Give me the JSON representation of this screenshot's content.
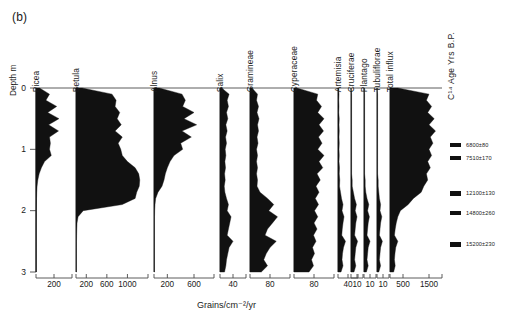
{
  "figure": {
    "panel_label": "(b)",
    "depth_axis_caption": "Depth m",
    "c14_caption": "C¹⁴ Age Yrs B.P.",
    "x_axis_caption": "Grains/cm⁻²/yr",
    "depth_ticks": [
      "0",
      "1",
      "2",
      "3"
    ],
    "fill_color": "#111111",
    "axis_color": "#4a4a4a"
  },
  "taxa": [
    {
      "name": "Picea",
      "ticks": [
        "200"
      ]
    },
    {
      "name": "Betula",
      "ticks": [
        "200",
        "600",
        "1000"
      ]
    },
    {
      "name": "Alnus",
      "ticks": [
        "200",
        "600"
      ]
    },
    {
      "name": "Salix",
      "ticks": [
        "40"
      ]
    },
    {
      "name": "Gramineae",
      "ticks": [
        "80"
      ]
    },
    {
      "name": "Cyperaceae",
      "ticks": [
        "80"
      ]
    },
    {
      "name": "Artemisia",
      "ticks": [
        "40"
      ]
    },
    {
      "name": "Cruciferae",
      "ticks": [
        "10"
      ]
    },
    {
      "name": "Plantago",
      "ticks": [
        "10"
      ]
    },
    {
      "name": "Tubuliflorae",
      "ticks": [
        "10"
      ]
    },
    {
      "name": "Total influx",
      "ticks": [
        "500",
        "1500"
      ]
    }
  ],
  "radiocarbon_dates": [
    {
      "label": "6800±80",
      "depth_m": 0.93
    },
    {
      "label": "7510±170",
      "depth_m": 1.14
    },
    {
      "label": "12100±130",
      "depth_m": 1.72
    },
    {
      "label": "14800±260",
      "depth_m": 2.04
    },
    {
      "label": "15200±230",
      "depth_m": 2.55
    }
  ],
  "chart_data": {
    "type": "area",
    "xlabel": "Grains/cm⁻²/yr",
    "ylabel": "Depth m",
    "ylim": [
      0,
      3
    ],
    "grid": false,
    "legend": "none",
    "orientation": "horizontal-area-vs-depth",
    "depths": [
      0.0,
      0.1,
      0.2,
      0.3,
      0.4,
      0.5,
      0.6,
      0.7,
      0.8,
      0.9,
      1.0,
      1.1,
      1.2,
      1.3,
      1.4,
      1.5,
      1.6,
      1.7,
      1.8,
      1.9,
      2.0,
      2.1,
      2.2,
      2.3,
      2.4,
      2.5,
      2.6,
      2.7,
      2.8,
      2.9,
      3.0
    ],
    "series": [
      {
        "name": "Picea",
        "xlim": [
          0,
          400
        ],
        "ticks": [
          200
        ],
        "values": [
          40,
          150,
          110,
          230,
          130,
          255,
          140,
          250,
          150,
          160,
          150,
          170,
          95,
          60,
          35,
          20,
          12,
          8,
          6,
          5,
          4,
          4,
          3,
          3,
          3,
          3,
          3,
          3,
          3,
          3,
          3
        ]
      },
      {
        "name": "Betula",
        "xlim": [
          0,
          1400
        ],
        "ticks": [
          200,
          600,
          1000
        ],
        "values": [
          120,
          700,
          780,
          760,
          850,
          800,
          880,
          760,
          900,
          820,
          870,
          900,
          1000,
          1150,
          1220,
          1240,
          1230,
          1180,
          1150,
          900,
          140,
          40,
          20,
          15,
          12,
          10,
          10,
          10,
          10,
          10,
          10
        ]
      },
      {
        "name": "Alnus",
        "xlim": [
          0,
          900
        ],
        "ticks": [
          200,
          600
        ],
        "values": [
          80,
          420,
          470,
          430,
          600,
          450,
          640,
          420,
          560,
          400,
          430,
          300,
          240,
          200,
          170,
          150,
          120,
          60,
          25,
          15,
          10,
          8,
          8,
          8,
          8,
          8,
          8,
          8,
          8,
          8,
          8
        ]
      },
      {
        "name": "Salix",
        "xlim": [
          0,
          80
        ],
        "ticks": [
          40
        ],
        "values": [
          5,
          28,
          22,
          26,
          20,
          24,
          18,
          22,
          17,
          20,
          16,
          18,
          15,
          17,
          14,
          16,
          13,
          15,
          20,
          26,
          22,
          34,
          30,
          26,
          22,
          40,
          28,
          24,
          20,
          18,
          14
        ]
      },
      {
        "name": "Gramineae",
        "xlim": [
          0,
          160
        ],
        "ticks": [
          80
        ],
        "values": [
          8,
          30,
          26,
          34,
          28,
          36,
          30,
          34,
          28,
          32,
          26,
          30,
          26,
          30,
          26,
          30,
          28,
          40,
          70,
          95,
          75,
          110,
          90,
          70,
          60,
          105,
          80,
          65,
          55,
          70,
          45
        ]
      },
      {
        "name": "Cyperaceae",
        "xlim": [
          0,
          160
        ],
        "ticks": [
          80
        ],
        "values": [
          12,
          95,
          90,
          110,
          95,
          120,
          100,
          118,
          98,
          112,
          95,
          120,
          100,
          115,
          92,
          105,
          88,
          100,
          85,
          98,
          82,
          95,
          80,
          92,
          78,
          88,
          74,
          82,
          70,
          78,
          60
        ]
      },
      {
        "name": "Artemisia",
        "xlim": [
          0,
          80
        ],
        "ticks": [
          40
        ],
        "values": [
          2,
          4,
          3,
          4,
          3,
          5,
          4,
          5,
          4,
          5,
          4,
          5,
          4,
          6,
          5,
          7,
          6,
          10,
          14,
          20,
          16,
          24,
          20,
          17,
          15,
          30,
          22,
          18,
          16,
          20,
          12
        ]
      },
      {
        "name": "Cruciferae",
        "xlim": [
          0,
          20
        ],
        "ticks": [
          10
        ],
        "values": [
          0,
          1,
          1,
          1,
          1,
          1,
          1,
          1,
          1,
          1,
          1,
          1,
          1,
          1,
          1,
          2,
          2,
          4,
          6,
          9,
          7,
          10,
          8,
          7,
          6,
          11,
          8,
          7,
          6,
          8,
          5
        ]
      },
      {
        "name": "Plantago",
        "xlim": [
          0,
          20
        ],
        "ticks": [
          10
        ],
        "values": [
          0,
          1,
          1,
          1,
          1,
          1,
          1,
          1,
          1,
          1,
          1,
          1,
          1,
          1,
          1,
          2,
          2,
          3,
          5,
          8,
          6,
          9,
          7,
          6,
          5,
          10,
          7,
          6,
          5,
          7,
          4
        ]
      },
      {
        "name": "Tubuliflorae",
        "xlim": [
          0,
          20
        ],
        "ticks": [
          10
        ],
        "values": [
          0,
          1,
          1,
          1,
          1,
          1,
          1,
          1,
          1,
          1,
          1,
          1,
          1,
          1,
          1,
          2,
          2,
          3,
          4,
          6,
          5,
          8,
          6,
          5,
          4,
          9,
          6,
          5,
          4,
          6,
          3
        ]
      },
      {
        "name": "Total influx",
        "xlim": [
          0,
          2000
        ],
        "ticks": [
          500,
          1500
        ],
        "values": [
          300,
          1500,
          1400,
          1600,
          1450,
          1700,
          1500,
          1750,
          1550,
          1650,
          1500,
          1600,
          1450,
          1550,
          1400,
          1450,
          1300,
          1200,
          900,
          700,
          400,
          300,
          240,
          200,
          170,
          300,
          220,
          190,
          170,
          200,
          140
        ]
      }
    ]
  }
}
